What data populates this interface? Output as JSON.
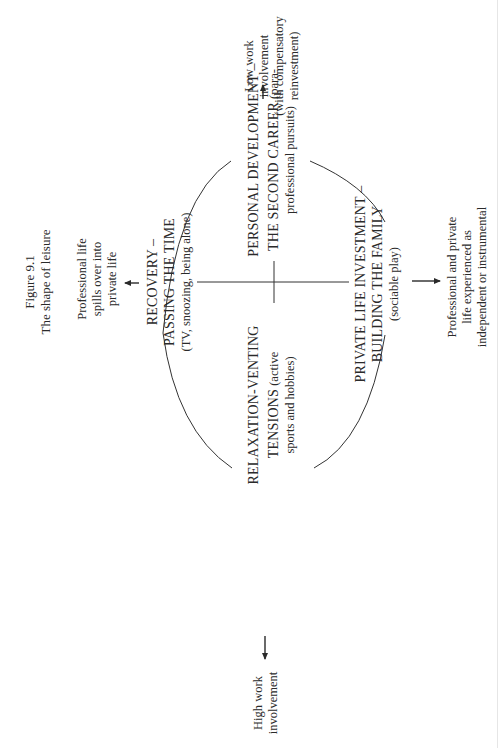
{
  "figure": {
    "number": "Figure 9.1",
    "title": "The shape of leisure"
  },
  "axes": {
    "top": {
      "direction": "Low work involvement",
      "lines": [
        "Low work",
        "involvement",
        "(with compensatory",
        "reinvestment)"
      ]
    },
    "bottom": {
      "direction": "High work involvement",
      "lines": [
        "High work",
        "involvement"
      ]
    },
    "left": {
      "direction": "Professional life spills over into private life",
      "lines": [
        "Professional life",
        "spills over into",
        "private life"
      ]
    },
    "right": {
      "direction": "Professional and private life experienced as independent or instrumental",
      "lines": [
        "Professional and private",
        "life experienced as",
        "independent or instrumental"
      ]
    }
  },
  "quadrants": {
    "recovery": {
      "lines": [
        "RECOVERY –",
        "PASSING THE TIME",
        "(TV, snoozing, being alone)"
      ]
    },
    "personal_development": {
      "line1": "PERSONAL DEVELOPMENT –",
      "line2_caps": "THE SECOND CAREER",
      "line2_tail": " (para-",
      "line3": "professional pursuits)"
    },
    "private_life": {
      "lines": [
        "PRIVATE LIFE INVESTMENT –",
        "BUILDING THE FAMILY",
        "(sociable play)"
      ]
    },
    "relaxation": {
      "line1": "RELAXATION-VENTING",
      "line2_caps": "TENSIONS",
      "line2_tail": " (active",
      "line3": "sports and hobbies)"
    }
  },
  "colors": {
    "ink": "#2a2a2a",
    "background": "#ffffff"
  }
}
